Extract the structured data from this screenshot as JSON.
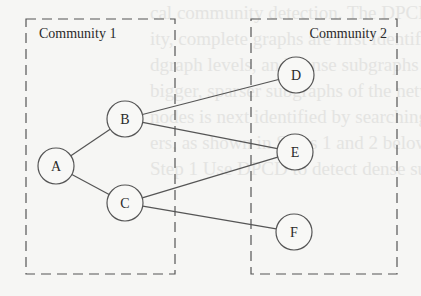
{
  "diagram": {
    "communities": [
      {
        "id": "community-1",
        "label": "Community 1",
        "x": 26,
        "y": 19,
        "w": 149,
        "h": 255
      },
      {
        "id": "community-2",
        "label": "Community 2",
        "x": 251,
        "y": 19,
        "w": 146,
        "h": 255
      }
    ],
    "nodes": [
      {
        "id": "A",
        "label": "A",
        "cx": 56,
        "cy": 166,
        "r": 18
      },
      {
        "id": "B",
        "label": "B",
        "cx": 125,
        "cy": 119,
        "r": 18
      },
      {
        "id": "C",
        "label": "C",
        "cx": 125,
        "cy": 203,
        "r": 18
      },
      {
        "id": "D",
        "label": "D",
        "cx": 296,
        "cy": 75,
        "r": 18
      },
      {
        "id": "E",
        "label": "E",
        "cx": 295,
        "cy": 152,
        "r": 18
      },
      {
        "id": "F",
        "label": "F",
        "cx": 294,
        "cy": 232,
        "r": 18
      }
    ],
    "edges": [
      {
        "from": "A",
        "to": "B"
      },
      {
        "from": "A",
        "to": "C"
      },
      {
        "from": "B",
        "to": "D"
      },
      {
        "from": "B",
        "to": "E"
      },
      {
        "from": "C",
        "to": "E"
      },
      {
        "from": "C",
        "to": "F"
      }
    ],
    "colors": {
      "stroke": "#555555",
      "node_fill": "#f8f8f6",
      "text": "#2a2a2a",
      "background": "#f6f6f4"
    }
  },
  "bleed_text": [
    "cal community detection. The DPCD",
    "ity, complete graphs are first identified",
    "dgraph levels, and dense subgraphs",
    "bigger, sparser subgraphs of the network",
    "nodes is next identified by searching",
    "ers, as shown in Steps 1 and 2 below",
    "",
    "Step 1 Use DPCD to detect dense subgraph"
  ]
}
